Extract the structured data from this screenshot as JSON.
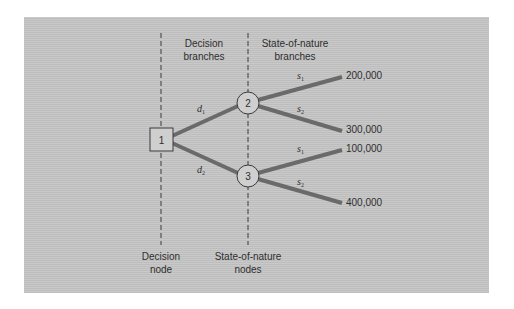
{
  "diagram": {
    "type": "decision-tree",
    "column_headers": {
      "decision_branches": [
        "Decision",
        "branches"
      ],
      "state_of_nature_branches": [
        "State-of-nature",
        "branches"
      ]
    },
    "column_footers": {
      "decision_node": [
        "Decision",
        "node"
      ],
      "state_of_nature_nodes": [
        "State-of-nature",
        "nodes"
      ]
    },
    "nodes": [
      {
        "id": "1",
        "shape": "square",
        "role": "decision"
      },
      {
        "id": "2",
        "shape": "circle",
        "role": "state-of-nature"
      },
      {
        "id": "3",
        "shape": "circle",
        "role": "state-of-nature"
      }
    ],
    "decision_edges": [
      {
        "from": "1",
        "to": "2",
        "label": "d",
        "sub": "1"
      },
      {
        "from": "1",
        "to": "3",
        "label": "d",
        "sub": "2"
      }
    ],
    "outcome_edges": [
      {
        "from": "2",
        "label": "s",
        "sub": "1",
        "payoff": "200,000"
      },
      {
        "from": "2",
        "label": "s",
        "sub": "2",
        "payoff": "300,000"
      },
      {
        "from": "3",
        "label": "s",
        "sub": "1",
        "payoff": "100,000"
      },
      {
        "from": "3",
        "label": "s",
        "sub": "2",
        "payoff": "400,000"
      }
    ],
    "colors": {
      "panel": "#c4c4c4",
      "branch": "#6a6a6a",
      "node_fill": "#cfcfcf",
      "node_stroke": "#3a3a3a",
      "text": "#2e2e2e"
    }
  }
}
